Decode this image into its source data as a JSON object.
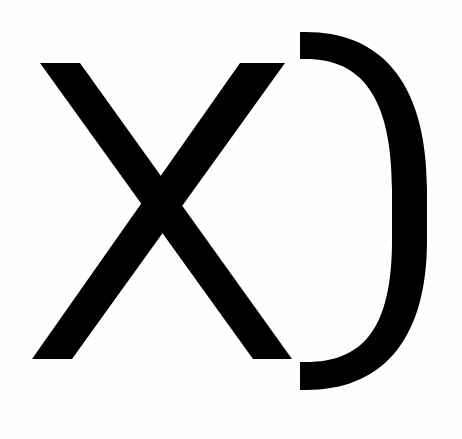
{
  "graphic": {
    "text": "XD",
    "description": "Large black 'XD' laughing emoticon on white background",
    "glyphs": [
      {
        "char": "X",
        "name": "letter-x"
      },
      {
        "char": "D",
        "name": "letter-d"
      }
    ],
    "colors": {
      "background": "#fefefe",
      "foreground": "#000000"
    }
  }
}
